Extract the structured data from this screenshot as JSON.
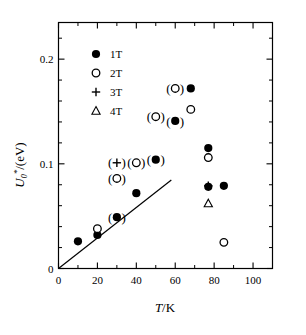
{
  "chart_data": {
    "type": "scatter",
    "title": "",
    "xlabel": "T/K",
    "ylabel": "U0*/(eV)",
    "xlim": [
      0,
      110
    ],
    "ylim": [
      0,
      0.235
    ],
    "grid": false,
    "legend_position": "top-left",
    "x_ticks_major": [
      0,
      20,
      40,
      60,
      80,
      100
    ],
    "x_tick_labels": [
      "0",
      "20",
      "40",
      "60",
      "80",
      "100"
    ],
    "x_ticks_minor": [
      10,
      30,
      50,
      70,
      90
    ],
    "y_ticks_major": [
      0,
      0.1,
      0.2
    ],
    "y_tick_labels": [
      "0",
      "0.1",
      "0.2"
    ],
    "y_ticks_minor": [
      0.02,
      0.04,
      0.06,
      0.08,
      0.12,
      0.14,
      0.16,
      0.18,
      0.22
    ],
    "series": [
      {
        "name": "1T",
        "marker": "filled-circle",
        "points": [
          {
            "x": 10,
            "y": 0.026,
            "paren": false
          },
          {
            "x": 20,
            "y": 0.032,
            "paren": false
          },
          {
            "x": 30,
            "y": 0.049,
            "paren": true
          },
          {
            "x": 40,
            "y": 0.072,
            "paren": false
          },
          {
            "x": 50,
            "y": 0.104,
            "paren": true
          },
          {
            "x": 60,
            "y": 0.141,
            "paren": true
          },
          {
            "x": 68,
            "y": 0.172,
            "paren": false
          },
          {
            "x": 77,
            "y": 0.115,
            "paren": false
          },
          {
            "x": 77,
            "y": 0.078,
            "paren": false
          },
          {
            "x": 85,
            "y": 0.079,
            "paren": false
          }
        ]
      },
      {
        "name": "2T",
        "marker": "open-circle",
        "points": [
          {
            "x": 20,
            "y": 0.038,
            "paren": false
          },
          {
            "x": 30,
            "y": 0.086,
            "paren": true
          },
          {
            "x": 40,
            "y": 0.101,
            "paren": true
          },
          {
            "x": 50,
            "y": 0.145,
            "paren": true
          },
          {
            "x": 60,
            "y": 0.172,
            "paren": true
          },
          {
            "x": 68,
            "y": 0.152,
            "paren": false
          },
          {
            "x": 77,
            "y": 0.106,
            "paren": false
          },
          {
            "x": 85,
            "y": 0.025,
            "paren": false
          }
        ]
      },
      {
        "name": "3T",
        "marker": "plus",
        "points": [
          {
            "x": 30,
            "y": 0.101,
            "paren": true
          },
          {
            "x": 77,
            "y": 0.079,
            "paren": false
          }
        ]
      },
      {
        "name": "4T",
        "marker": "triangle",
        "points": [
          {
            "x": 77,
            "y": 0.062,
            "paren": false
          }
        ]
      }
    ],
    "trend_line": {
      "x0": 0,
      "y0": 0.0,
      "x1": 58,
      "y1": 0.0845
    },
    "annotations": [
      "Markers shown in parentheses indicate bracketed data values"
    ]
  },
  "legend": {
    "entries": [
      {
        "label": "1T",
        "marker": "filled-circle"
      },
      {
        "label": "2T",
        "marker": "open-circle"
      },
      {
        "label": "3T",
        "marker": "plus"
      },
      {
        "label": "4T",
        "marker": "triangle"
      }
    ]
  },
  "axis_titles": {
    "y_main": "U",
    "y_sub": "0",
    "y_sup": "*",
    "y_tail": "/(eV)",
    "x_italic": "T",
    "x_rest": "/K"
  }
}
